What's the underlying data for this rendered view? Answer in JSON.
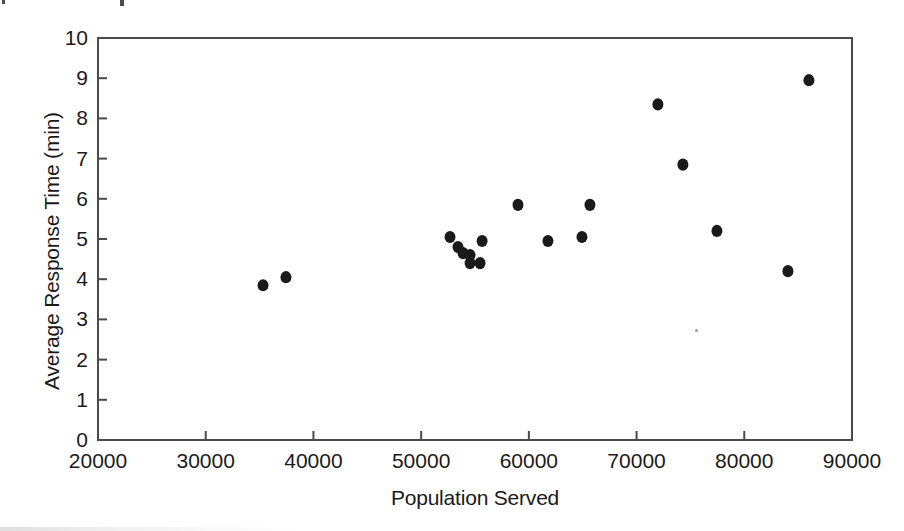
{
  "chart_data": {
    "type": "scatter",
    "title": "",
    "xlabel": "Population Served",
    "ylabel": "Average Response Time (min)",
    "xlim": [
      20000,
      90000
    ],
    "ylim": [
      0,
      10
    ],
    "xticks": [
      20000,
      30000,
      40000,
      50000,
      60000,
      70000,
      80000,
      90000
    ],
    "yticks": [
      0,
      1,
      2,
      3,
      4,
      5,
      6,
      7,
      8,
      9,
      10
    ],
    "xtick_labels": [
      "20000",
      "30000",
      "40000",
      "50000",
      "60000",
      "70000",
      "80000",
      "90000"
    ],
    "ytick_labels": [
      "0",
      "1",
      "2",
      "3",
      "4",
      "5",
      "6",
      "7",
      "8",
      "9",
      "10"
    ],
    "grid": false,
    "legend": null,
    "marker": {
      "shape": "circle",
      "color": "#1a1a1a",
      "size_px": 11
    },
    "points": [
      {
        "x": 35320,
        "y": 3.85
      },
      {
        "x": 37450,
        "y": 4.05
      },
      {
        "x": 52680,
        "y": 5.05
      },
      {
        "x": 53420,
        "y": 4.8
      },
      {
        "x": 53890,
        "y": 4.65
      },
      {
        "x": 54540,
        "y": 4.6
      },
      {
        "x": 54540,
        "y": 4.4
      },
      {
        "x": 55470,
        "y": 4.4
      },
      {
        "x": 55660,
        "y": 4.95
      },
      {
        "x": 58990,
        "y": 5.85
      },
      {
        "x": 61770,
        "y": 4.95
      },
      {
        "x": 64930,
        "y": 5.05
      },
      {
        "x": 65670,
        "y": 5.85
      },
      {
        "x": 71980,
        "y": 8.35
      },
      {
        "x": 74300,
        "y": 6.85
      },
      {
        "x": 77460,
        "y": 5.2
      },
      {
        "x": 84050,
        "y": 4.2
      },
      {
        "x": 86000,
        "y": 8.95
      }
    ]
  },
  "axis": {
    "y_title": "Average Response Time (min)",
    "x_title": "Population Served"
  },
  "frame": {
    "color": "#4a4a4a"
  }
}
